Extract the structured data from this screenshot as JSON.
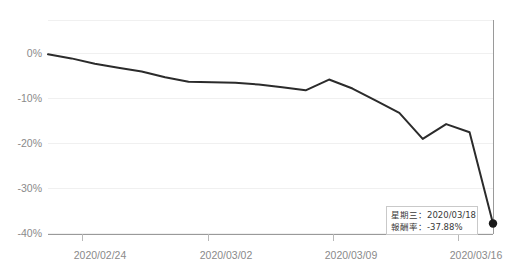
{
  "chart_data": {
    "type": "line",
    "title": "",
    "xlabel": "",
    "ylabel": "",
    "ylim": [
      -40,
      2
    ],
    "yticks": [
      "0%",
      "-10%",
      "-20%",
      "-30%",
      "-40%"
    ],
    "ytick_values": [
      0,
      -10,
      -20,
      -30,
      -40
    ],
    "xticks": [
      "2020/02/24",
      "2020/03/02",
      "2020/03/09",
      "2020/03/16"
    ],
    "grid": true,
    "legend": "none",
    "series": [
      {
        "name": "報酬率",
        "color": "#2b2b2b",
        "x": [
          "2020/02/20",
          "2020/02/21",
          "2020/02/24",
          "2020/02/25",
          "2020/02/26",
          "2020/02/27",
          "2020/03/02",
          "2020/03/03",
          "2020/03/04",
          "2020/03/05",
          "2020/03/06",
          "2020/03/09",
          "2020/03/10",
          "2020/03/11",
          "2020/03/12",
          "2020/03/13",
          "2020/03/16",
          "2020/03/17",
          "2020/03/18"
        ],
        "values": [
          -0.3,
          -1.2,
          -2.4,
          -3.3,
          -4.1,
          -5.4,
          -6.4,
          -6.5,
          -6.6,
          -7.0,
          -7.6,
          -8.3,
          -5.9,
          -7.9,
          -10.6,
          -13.3,
          -19.1,
          -15.8,
          -17.6
        ]
      }
    ],
    "annotations": {
      "endpoint": {
        "label": "-37.88%",
        "marker": "filled-circle",
        "color": "#1a1a1a"
      }
    }
  },
  "tooltip": {
    "date_key": "星期三",
    "date_separator": "：",
    "date_value": "2020/03/18",
    "return_key": "報酬率",
    "return_separator": "：",
    "return_value": "-37.88%"
  }
}
